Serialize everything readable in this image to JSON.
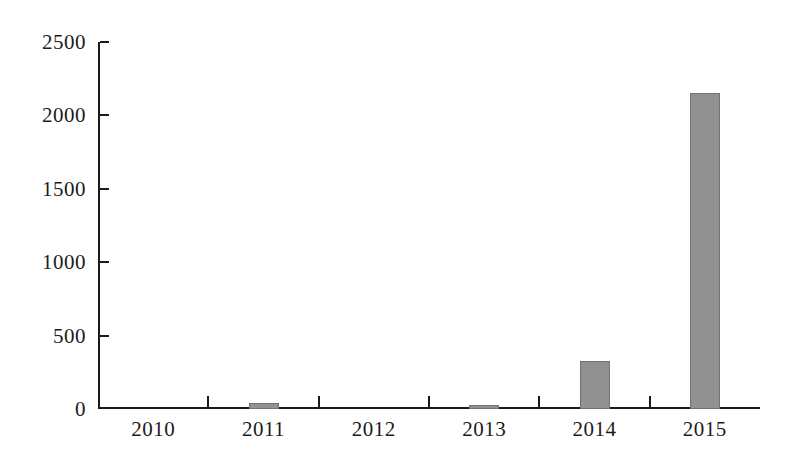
{
  "chart_data": {
    "type": "bar",
    "categories": [
      "2010",
      "2011",
      "2012",
      "2013",
      "2014",
      "2015"
    ],
    "values": [
      0,
      40,
      0,
      30,
      330,
      2150
    ],
    "title": "",
    "xlabel": "",
    "ylabel": "",
    "ylim": [
      0,
      2500
    ],
    "yticks": [
      0,
      500,
      1000,
      1500,
      2000,
      2500
    ],
    "grid": false,
    "legend": false,
    "bar_color": "#919191",
    "axis_color": "#1a1a1a",
    "background_color": "#ffffff"
  }
}
